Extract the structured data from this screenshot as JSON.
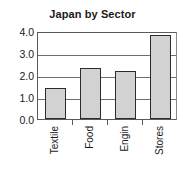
{
  "chart_data": {
    "type": "bar",
    "title": "Japan by Sector",
    "xlabel": "",
    "ylabel": "",
    "categories": [
      "Textile",
      "Food",
      "Engin",
      "Stores"
    ],
    "values": [
      1.4,
      2.3,
      2.2,
      3.8
    ],
    "ylim": [
      0.0,
      4.0
    ],
    "ytick_labels": [
      "0.0",
      "1.0",
      "2.0",
      "3.0",
      "4.0"
    ],
    "ytick_values": [
      0.0,
      1.0,
      2.0,
      3.0,
      4.0
    ],
    "grid": true,
    "legend": false,
    "series": [
      {
        "name": "Japan by Sector",
        "values": [
          1.4,
          2.3,
          2.2,
          3.8
        ]
      }
    ],
    "colors": {
      "bar_fill": "#d2d2d2",
      "bar_border": "#2b2b2b",
      "gridline": "#6e6e6e",
      "axis": "#5a5a5a",
      "text": "#1a1a1a",
      "background": "#ffffff"
    }
  }
}
